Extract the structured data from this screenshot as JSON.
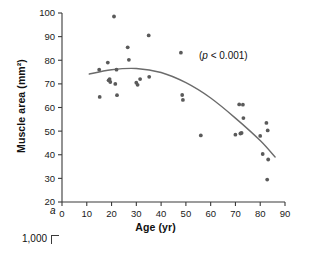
{
  "figure": {
    "panel_label": "a",
    "annotation": "(p < 0.001)",
    "annotation_symbol": "p",
    "annotation_rest": " < 0.001)",
    "annotation_open": "(",
    "next_panel_partial_label": "1,000"
  },
  "chart_data": {
    "type": "scatter",
    "title": "",
    "xlabel": "Age (yr)",
    "ylabel": "Muscle area (mm²)",
    "xlim": [
      0,
      90
    ],
    "ylim": [
      20,
      100
    ],
    "xticks": [
      0,
      10,
      20,
      30,
      40,
      50,
      60,
      70,
      80,
      90
    ],
    "yticks": [
      20,
      30,
      40,
      50,
      60,
      70,
      80,
      90,
      100
    ],
    "grid": false,
    "legend": null,
    "annotations": [
      {
        "text": "(p < 0.001)",
        "x": 62,
        "y": 86
      }
    ],
    "point_color": "#5a5a5a",
    "line_color": "#6b6b6b",
    "series": [
      {
        "name": "Muscle area vs Age",
        "points": [
          [
            15.0,
            76.0
          ],
          [
            15.2,
            64.5
          ],
          [
            18.5,
            79.0
          ],
          [
            18.8,
            71.5
          ],
          [
            19.2,
            72.0
          ],
          [
            19.5,
            70.8
          ],
          [
            21.0,
            98.5
          ],
          [
            21.5,
            70.0
          ],
          [
            22.0,
            76.0
          ],
          [
            22.2,
            65.2
          ],
          [
            26.5,
            85.5
          ],
          [
            27.0,
            80.2
          ],
          [
            30.0,
            70.5
          ],
          [
            30.5,
            69.6
          ],
          [
            31.5,
            72.0
          ],
          [
            35.0,
            90.5
          ],
          [
            35.2,
            73.0
          ],
          [
            48.0,
            83.2
          ],
          [
            48.5,
            65.3
          ],
          [
            48.8,
            63.2
          ],
          [
            56.0,
            48.2
          ],
          [
            70.0,
            48.5
          ],
          [
            71.5,
            61.3
          ],
          [
            72.0,
            49.0
          ],
          [
            72.5,
            49.2
          ],
          [
            73.0,
            61.2
          ],
          [
            73.2,
            55.5
          ],
          [
            80.0,
            48.0
          ],
          [
            81.0,
            40.3
          ],
          [
            82.5,
            53.5
          ],
          [
            83.0,
            50.3
          ],
          [
            83.2,
            38.0
          ],
          [
            82.8,
            29.5
          ]
        ]
      }
    ],
    "fit_curve": {
      "type": "quadratic",
      "description": "fitted regression curve",
      "x_range": [
        11,
        86
      ],
      "sample_points": [
        [
          11,
          74.2
        ],
        [
          20,
          76.0
        ],
        [
          30,
          76.5
        ],
        [
          40,
          74.8
        ],
        [
          50,
          70.5
        ],
        [
          60,
          64.0
        ],
        [
          70,
          55.5
        ],
        [
          80,
          46.0
        ],
        [
          86,
          39.0
        ]
      ]
    }
  }
}
